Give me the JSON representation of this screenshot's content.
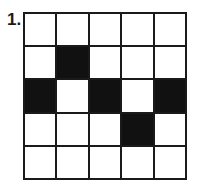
{
  "label": "1.",
  "grid": {
    "rows": 5,
    "cols": 5,
    "cells": [
      [
        0,
        0,
        0,
        0,
        0
      ],
      [
        0,
        1,
        0,
        0,
        0
      ],
      [
        1,
        0,
        1,
        0,
        1
      ],
      [
        0,
        0,
        0,
        1,
        0
      ],
      [
        0,
        0,
        0,
        0,
        0
      ]
    ],
    "filled_color": "#111111",
    "empty_color": "#ffffff"
  }
}
